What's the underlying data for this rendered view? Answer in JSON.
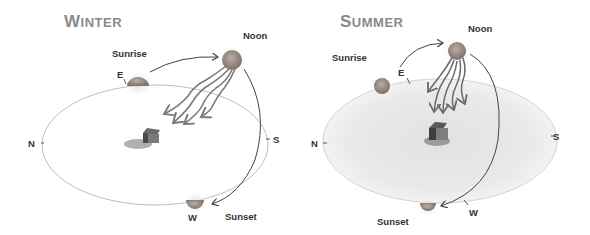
{
  "panels": [
    {
      "id": "winter",
      "title_first": "W",
      "title_rest": "INTER",
      "labels": {
        "noon": "Noon",
        "sunrise": "Sunrise",
        "sunset": "Sunset",
        "east": "E",
        "west": "W",
        "north": "N",
        "south": "S"
      }
    },
    {
      "id": "summer",
      "title_first": "S",
      "title_rest": "UMMER",
      "labels": {
        "noon": "Noon",
        "sunrise": "Sunrise",
        "sunset": "Sunset",
        "east": "E",
        "west": "W",
        "north": "N",
        "south": "S"
      }
    }
  ],
  "colors": {
    "title": "#8a8a8a",
    "label": "#333333",
    "sun": "#9a8f88",
    "ground_summer": "#e6e6e6",
    "ellipse_stroke": "#bbbbbb"
  }
}
